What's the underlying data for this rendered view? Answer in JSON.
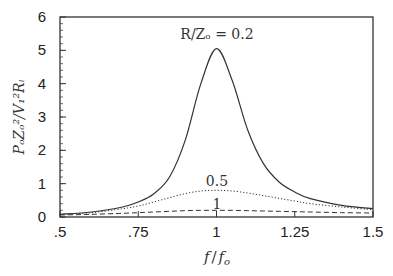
{
  "chart_data": {
    "type": "line",
    "title": "",
    "xlabel": "f/f_o",
    "ylabel": "P_O Z_o^2 / V_I^2 R_i",
    "xlim": [
      0.5,
      1.5
    ],
    "ylim": [
      0,
      6
    ],
    "xticks": [
      0.5,
      0.75,
      1,
      1.25,
      1.5
    ],
    "xtick_labels": [
      ".5",
      ".75",
      "1",
      "1.25",
      "1.5"
    ],
    "yticks": [
      0,
      1,
      2,
      3,
      4,
      5,
      6
    ],
    "ytick_labels": [
      "0",
      "1",
      "2",
      "3",
      "4",
      "5",
      "6"
    ],
    "grid": false,
    "legend": "none (inline annotations)",
    "x": [
      0.5,
      0.6,
      0.7,
      0.75,
      0.8,
      0.85,
      0.9,
      0.95,
      1.0,
      1.05,
      1.1,
      1.15,
      1.2,
      1.25,
      1.3,
      1.4,
      1.5
    ],
    "series": [
      {
        "name": "R/Z_o = 0.2",
        "style": "solid",
        "values": [
          0.08,
          0.15,
          0.3,
          0.45,
          0.7,
          1.2,
          2.3,
          4.0,
          5.05,
          4.1,
          2.6,
          1.6,
          1.05,
          0.75,
          0.55,
          0.35,
          0.25
        ]
      },
      {
        "name": "0.5",
        "style": "dotted",
        "values": [
          0.08,
          0.13,
          0.25,
          0.33,
          0.45,
          0.58,
          0.7,
          0.78,
          0.8,
          0.78,
          0.72,
          0.64,
          0.56,
          0.48,
          0.4,
          0.3,
          0.22
        ]
      },
      {
        "name": "1",
        "style": "dashed",
        "values": [
          0.06,
          0.08,
          0.11,
          0.13,
          0.15,
          0.17,
          0.19,
          0.2,
          0.2,
          0.2,
          0.19,
          0.18,
          0.17,
          0.16,
          0.15,
          0.13,
          0.12
        ]
      }
    ],
    "annotations": [
      {
        "text": "R/Z_o = 0.2",
        "x": 1.0,
        "y": 5.45
      },
      {
        "text": "0.5",
        "x": 1.0,
        "y": 1.05
      },
      {
        "text": "1",
        "x": 1.0,
        "y": 0.35
      }
    ]
  },
  "labels": {
    "xlabel_f": "f",
    "xlabel_sep": "/",
    "xlabel_fo": "f",
    "xlabel_fo_sub": "o",
    "ylabel": "PₒZₒ²/V₁²Rᵢ",
    "annot_02": "R/Zₒ = 0.2",
    "annot_05": "0.5",
    "annot_1": "1"
  }
}
